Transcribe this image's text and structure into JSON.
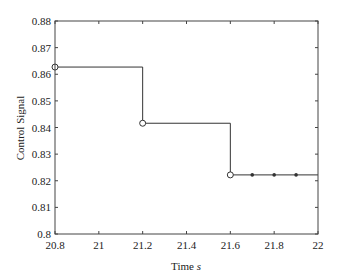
{
  "chart_data": {
    "type": "line",
    "subtype": "step",
    "title": "",
    "xlabel": "Time",
    "xlabel_unit": "s",
    "ylabel": "Control Signal",
    "xlim": [
      20.8,
      22
    ],
    "ylim": [
      0.8,
      0.88
    ],
    "grid": false,
    "legend": null,
    "x_ticks": [
      "20.8",
      "21",
      "21.2",
      "21.4",
      "21.6",
      "21.8",
      "22"
    ],
    "y_ticks": [
      "0.8",
      "0.81",
      "0.82",
      "0.83",
      "0.84",
      "0.85",
      "0.86",
      "0.87",
      "0.88"
    ],
    "series": [
      {
        "name": "control-signal",
        "step_points": [
          {
            "x": 20.8,
            "y": 0.8627
          },
          {
            "x": 21.2,
            "y": 0.8416
          },
          {
            "x": 21.6,
            "y": 0.8222
          },
          {
            "x": 22.0,
            "y": 0.8222
          }
        ],
        "open_circle_markers": [
          {
            "x": 20.8,
            "y": 0.8627
          },
          {
            "x": 21.2,
            "y": 0.8416
          },
          {
            "x": 21.6,
            "y": 0.8222
          }
        ],
        "filled_dot_markers": [
          {
            "x": 21.7,
            "y": 0.8222
          },
          {
            "x": 21.8,
            "y": 0.8222
          },
          {
            "x": 21.9,
            "y": 0.8222
          }
        ]
      }
    ]
  },
  "colors": {
    "line": "#333333",
    "axis": "#444444",
    "text": "#222222"
  }
}
